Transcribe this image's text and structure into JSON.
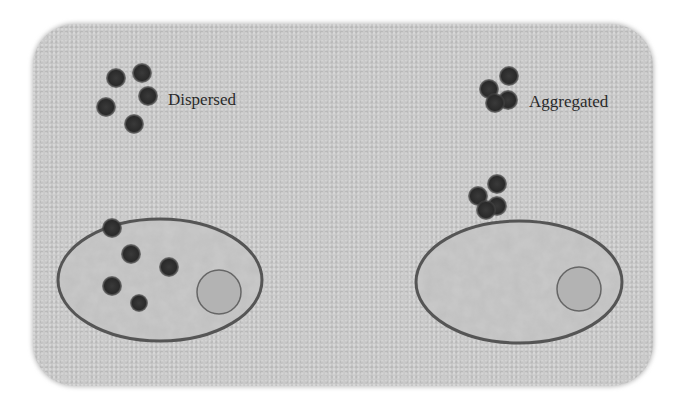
{
  "labels": {
    "dispersed": "Dispersed",
    "aggregated": "Aggregated"
  },
  "colors": {
    "background": "#c9c9c9",
    "particle": "#2e2e2e",
    "cell_outline": "#555555",
    "cell_fill": "#bdbdbd",
    "nucleus_fill": "#b0b0b0"
  },
  "diagram": {
    "panels": [
      {
        "name": "dispersed",
        "label": "Dispersed",
        "free_particles": 5,
        "cell_particles": 5
      },
      {
        "name": "aggregated",
        "label": "Aggregated",
        "free_particles": 4,
        "cell_particles": 4
      }
    ]
  }
}
